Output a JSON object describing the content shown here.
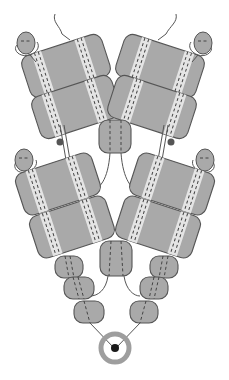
{
  "diagram": {
    "title": "",
    "colors": {
      "block_fill": "#a9a9a9",
      "block_stroke": "#555555",
      "stripe": "#e4e4e4",
      "dash": "#444444",
      "ring": "#9e9e9e",
      "hub": "#1a1a1a",
      "background": "#ffffff"
    },
    "branches": [
      {
        "side": "left",
        "large_blocks": 4,
        "heads": 2,
        "small_segments": 3,
        "beads": 1
      },
      {
        "side": "right",
        "large_blocks": 4,
        "heads": 2,
        "small_segments": 3,
        "beads": 1
      }
    ],
    "center_blocks": 2,
    "hub": {
      "shape": "ring",
      "inner": "dot"
    }
  }
}
